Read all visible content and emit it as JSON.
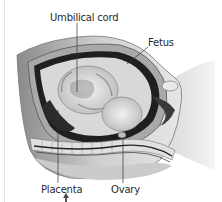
{
  "figure": {
    "type": "anatomical illustration",
    "labels": {
      "umbilical_cord": "Umbilical cord",
      "fetus": "Fetus",
      "placenta": "Placenta",
      "ovary": "Ovary"
    },
    "colors": {
      "background": "#ffffff",
      "text": "#2a2a2a",
      "leader_line": "#333333"
    },
    "icons": [
      "up-arrow-icon"
    ]
  }
}
